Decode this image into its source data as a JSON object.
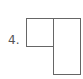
{
  "diagram": {
    "label": "4.",
    "shapes": [
      {
        "name": "square",
        "x": 26,
        "y": 18,
        "w": 28,
        "h": 29
      },
      {
        "name": "tall-rectangle",
        "x": 53,
        "y": 18,
        "w": 28,
        "h": 57
      }
    ],
    "stroke_color": "#666666"
  }
}
